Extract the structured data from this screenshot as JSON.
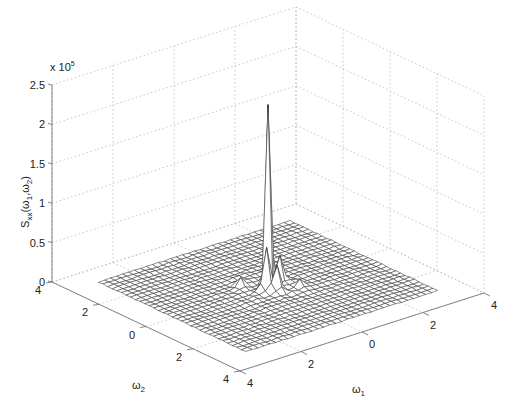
{
  "chart_data": {
    "type": "surface",
    "title": "",
    "xlabel": "ω1",
    "ylabel": "ω2",
    "zlabel": "Sxx(ω1,ω2)",
    "z_multiplier": "x 10^5",
    "x_ticks": [
      {
        "value": -4,
        "label": "4"
      },
      {
        "value": -2,
        "label": "2"
      },
      {
        "value": 0,
        "label": "0"
      },
      {
        "value": 2,
        "label": "2"
      },
      {
        "value": 4,
        "label": "4"
      }
    ],
    "y_ticks": [
      {
        "value": -4,
        "label": "4"
      },
      {
        "value": -2,
        "label": "2"
      },
      {
        "value": 0,
        "label": "0"
      },
      {
        "value": 2,
        "label": "2"
      },
      {
        "value": 4,
        "label": "4"
      }
    ],
    "z_ticks": [
      {
        "value": 0,
        "label": "0"
      },
      {
        "value": 0.5,
        "label": "0.5"
      },
      {
        "value": 1,
        "label": "1"
      },
      {
        "value": 1.5,
        "label": "1.5"
      },
      {
        "value": 2,
        "label": "2"
      },
      {
        "value": 2.5,
        "label": "2.5"
      }
    ],
    "xlim": [
      -4,
      4
    ],
    "ylim": [
      -4,
      4
    ],
    "zlim": [
      0,
      2.5
    ],
    "grid": true,
    "surface": {
      "grid_size": 32,
      "domain": [
        -3.14,
        3.14
      ],
      "peak": {
        "x": 0,
        "y": 0,
        "z": 2.3
      },
      "secondary_peaks": [
        {
          "x": 0.2,
          "y": -0.2,
          "z": 0.55
        },
        {
          "x": -0.2,
          "y": 0.2,
          "z": 0.5
        },
        {
          "x": 0.4,
          "y": 0.0,
          "z": 0.3
        },
        {
          "x": 0.0,
          "y": 0.4,
          "z": 0.28
        },
        {
          "x": -0.6,
          "y": -0.4,
          "z": 0.12
        },
        {
          "x": 0.6,
          "y": 0.6,
          "z": 0.1
        }
      ],
      "baseline": 0.01,
      "color": "#ffffff",
      "edge_color": "#333333"
    }
  }
}
